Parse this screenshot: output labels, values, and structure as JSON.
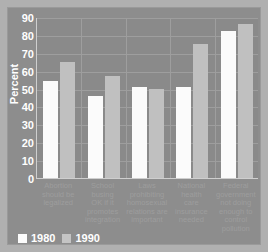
{
  "chart_data": {
    "type": "bar",
    "title": "",
    "xlabel": "",
    "ylabel": "Percent",
    "ylim": [
      0,
      90
    ],
    "yticks": [
      90,
      80,
      70,
      60,
      50,
      40,
      30,
      20,
      10,
      0
    ],
    "grid": true,
    "legend_position": "bottom-left",
    "categories": [
      "Abortion should be legalized",
      "School busing OK if it promotes integration",
      "Laws prohibiting homosexual relations are important",
      "National health care insurance needed",
      "Federal government not doing enough to control pollution"
    ],
    "category_lines": [
      [
        "Abortion",
        "should be",
        "legalized"
      ],
      [
        "School",
        "busing",
        "OK if it",
        "promotes",
        "integration"
      ],
      [
        "Laws",
        "prohibiting",
        "homosexual",
        "relations are",
        "important"
      ],
      [
        "National",
        "health",
        "care",
        "insurance",
        "needed"
      ],
      [
        "Federal",
        "government",
        "not doing",
        "enough to",
        "control",
        "pollution"
      ]
    ],
    "series": [
      {
        "name": "1980",
        "color": "#fbfbfb",
        "values": [
          54,
          46,
          51,
          51,
          82
        ]
      },
      {
        "name": "1990",
        "color": "#c0c0c0",
        "values": [
          65,
          57,
          50,
          75,
          86
        ]
      }
    ]
  },
  "legend": {
    "items": [
      {
        "label": "1980",
        "swatch": "#fbfbfb"
      },
      {
        "label": "1990",
        "swatch": "#c4c4c4"
      }
    ]
  },
  "colors": {
    "plot_background": "#8a8a8a",
    "figure_background": "#8d8d8d",
    "page_background": "#b0b0b0",
    "gridline": "#9e9e9e",
    "axis_text": "#ffffff",
    "category_text": "#9d9d9d"
  }
}
